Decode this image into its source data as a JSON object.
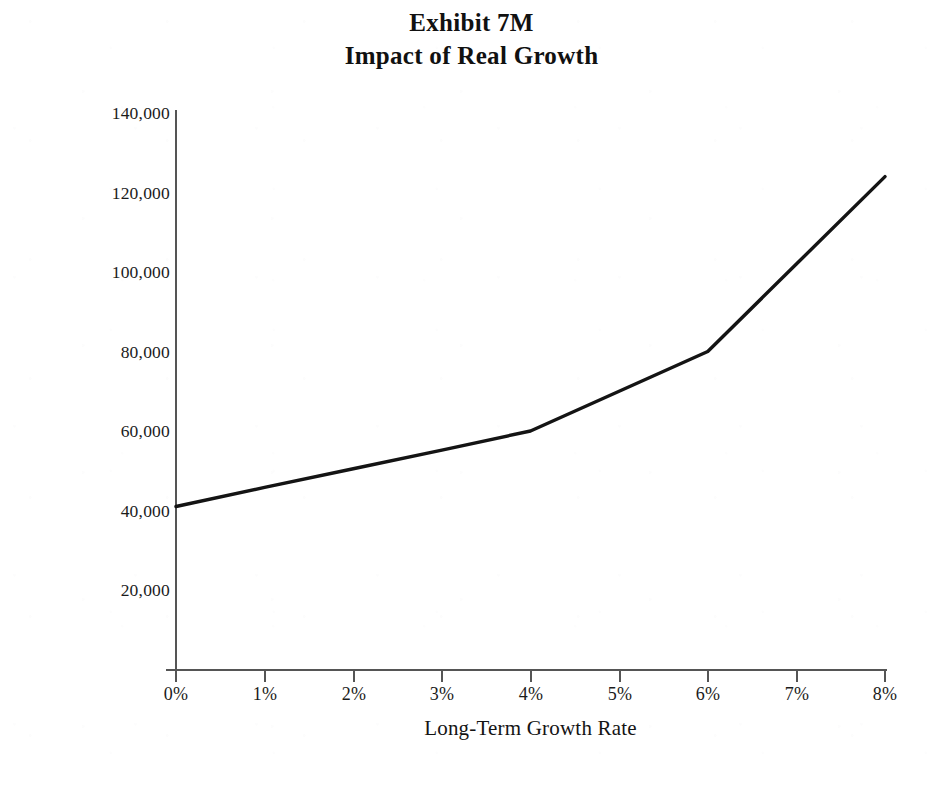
{
  "title": {
    "line1": "Exhibit 7M",
    "line2": "Impact of Real Growth"
  },
  "axes": {
    "x_title": "Long-Term Growth Rate",
    "y_title": "Capitalized Cash Flow ($000)"
  },
  "colors": {
    "background": "#ffffff",
    "text": "#1a1a1a",
    "axis_line": "#555555",
    "series_line": "#141414"
  },
  "chart_data": {
    "type": "line",
    "xlabel": "Long-Term Growth Rate",
    "ylabel": "Capitalized Cash Flow ($000)",
    "categories": [
      "0%",
      "1%",
      "2%",
      "3%",
      "4%",
      "5%",
      "6%",
      "7%",
      "8%"
    ],
    "x": [
      0,
      1,
      2,
      3,
      4,
      5,
      6,
      7,
      8
    ],
    "values": [
      41000,
      45800,
      50500,
      55200,
      60000,
      70000,
      80000,
      102000,
      124000
    ],
    "series": [
      {
        "name": "Capitalized Cash Flow",
        "values": [
          41000,
          45800,
          50500,
          55200,
          60000,
          70000,
          80000,
          102000,
          124000
        ]
      }
    ],
    "xlim": [
      0,
      8
    ],
    "ylim": [
      0,
      140000
    ],
    "x_tick_labels": [
      "0%",
      "1%",
      "2%",
      "3%",
      "4%",
      "5%",
      "6%",
      "7%",
      "8%"
    ],
    "y_tick_labels": [
      "140,000",
      "120,000",
      "100,000",
      "80,000",
      "60,000",
      "40,000",
      "20,000"
    ],
    "y_tick_values": [
      140000,
      120000,
      100000,
      80000,
      60000,
      40000,
      20000
    ],
    "grid": false,
    "legend": false,
    "legend_position": "none"
  }
}
